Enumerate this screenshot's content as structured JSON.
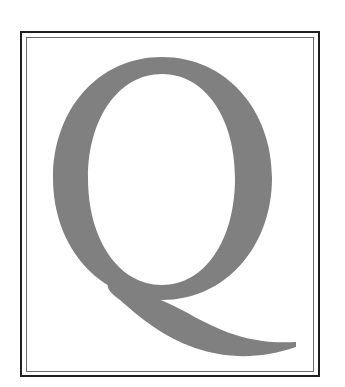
{
  "illustration": {
    "letter": "Q",
    "glyph_color": "#808080",
    "frame_outer_color": "#1e1e1e",
    "frame_inner_color": "#6a6a6a",
    "background_color": "#ffffff"
  }
}
